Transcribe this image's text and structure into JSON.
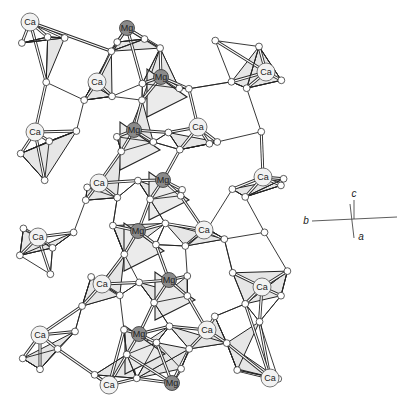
{
  "figure": {
    "background": "#ffffff",
    "colors": {
      "bond": "#2a2a2a",
      "bond_inner": "#ffffff",
      "polyhedron_fill": "#e6e6e6",
      "polyhedron_stroke": "#222222",
      "ca_fill": "#f2f2f2",
      "mg_fill": "#8a8a8a",
      "oxygen_fill": "#ffffff"
    }
  },
  "atoms": {
    "ca": [
      {
        "label": "Ca",
        "x": 30,
        "y": 22
      },
      {
        "label": "Ca",
        "x": 97,
        "y": 82
      },
      {
        "label": "Ca",
        "x": 35,
        "y": 132
      },
      {
        "label": "Ca",
        "x": 198,
        "y": 127
      },
      {
        "label": "Ca",
        "x": 266,
        "y": 72
      },
      {
        "label": "Ca",
        "x": 99,
        "y": 183
      },
      {
        "label": "Ca",
        "x": 263,
        "y": 177
      },
      {
        "label": "Ca",
        "x": 38,
        "y": 237
      },
      {
        "label": "Ca",
        "x": 204,
        "y": 230
      },
      {
        "label": "Ca",
        "x": 262,
        "y": 287
      },
      {
        "label": "Ca",
        "x": 102,
        "y": 284
      },
      {
        "label": "Ca",
        "x": 40,
        "y": 335
      },
      {
        "label": "Ca",
        "x": 207,
        "y": 330
      },
      {
        "label": "Ca",
        "x": 109,
        "y": 385
      },
      {
        "label": "Ca",
        "x": 270,
        "y": 378
      }
    ],
    "mg": [
      {
        "label": "Mg",
        "x": 127,
        "y": 28
      },
      {
        "label": "Mg",
        "x": 161,
        "y": 77
      },
      {
        "label": "Mg",
        "x": 134,
        "y": 130
      },
      {
        "label": "Mg",
        "x": 163,
        "y": 180
      },
      {
        "label": "Mg",
        "x": 138,
        "y": 231
      },
      {
        "label": "Mg",
        "x": 169,
        "y": 280
      },
      {
        "label": "Mg",
        "x": 139,
        "y": 334
      },
      {
        "label": "Mg",
        "x": 172,
        "y": 383
      }
    ]
  },
  "axes": {
    "labels": {
      "c": "c",
      "b": "b",
      "a": "a"
    },
    "origin": {
      "x": 352,
      "y": 219
    }
  }
}
